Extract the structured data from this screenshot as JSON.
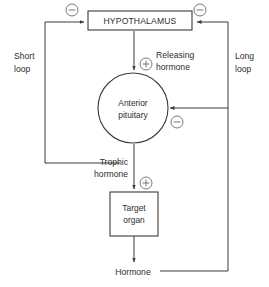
{
  "diagram": {
    "nodes": {
      "hypothalamus": {
        "label": "HYPOTHALAMUS",
        "shape": "rectangle"
      },
      "anterior_pituitary": {
        "line1": "Anterior",
        "line2": "pituitary",
        "shape": "circle"
      },
      "target_organ": {
        "line1": "Target",
        "line2": "organ",
        "shape": "rectangle"
      }
    },
    "edge_labels": {
      "releasing_hormone_line1": "Releasing",
      "releasing_hormone_line2": "hormone",
      "trophic_hormone_line1": "Trophic",
      "trophic_hormone_line2": "hormone",
      "hormone": "Hormone"
    },
    "loops": {
      "short_loop_line1": "Short",
      "short_loop_line2": "loop",
      "long_loop_line1": "Long",
      "long_loop_line2": "loop"
    },
    "signs": {
      "hypothalamus_short_loop_feedback": "−",
      "hypothalamus_long_loop_feedback": "−",
      "releasing_hormone_stimulus": "+",
      "pituitary_long_loop_feedback": "−",
      "trophic_hormone_stimulus": "+"
    },
    "colors": {
      "background": "#ffffff",
      "stroke": "#3b3b3b",
      "sign_stroke": "#6a6a6a",
      "text": "#2e2e2e"
    }
  }
}
